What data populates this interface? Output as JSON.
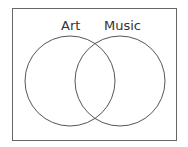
{
  "diagram": {
    "type": "venn",
    "sets": [
      {
        "label": "Art"
      },
      {
        "label": "Music"
      }
    ],
    "stroke_color": "#555555"
  }
}
